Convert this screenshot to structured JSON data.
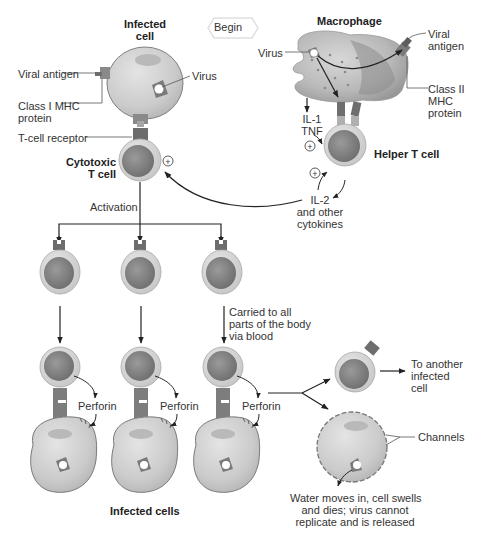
{
  "begin_label": "Begin",
  "labels": {
    "infected_cell": "Infected cell",
    "infected_cell_l1": "Infected",
    "infected_cell_l2": "cell",
    "viral_antigen_left": "Viral antigen",
    "virus_left": "Virus",
    "class1_l1": "Class I MHC",
    "class1_l2": "protein",
    "tcell_receptor": "T-cell receptor",
    "cytotoxic_l1": "Cytotoxic",
    "cytotoxic_l2": "T cell",
    "macrophage": "Macrophage",
    "virus_right": "Virus",
    "viral_antigen_r1": "Viral",
    "viral_antigen_r2": "antigen",
    "class2_l1": "Class II",
    "class2_l2": "MHC",
    "class2_l3": "protein",
    "il1": "IL-1",
    "tnf": "TNF",
    "helper_tcell": "Helper T cell",
    "il2_l1": "IL-2",
    "il2_l2": "and other",
    "il2_l3": "cytokines",
    "activation": "Activation",
    "carried_l1": "Carried to all",
    "carried_l2": "parts of the body",
    "carried_l3": "via blood",
    "perforin": "Perforin",
    "infected_cells": "Infected cells",
    "another_l1": "To another",
    "another_l2": "infected",
    "another_l3": "cell",
    "channels": "Channels",
    "water_l1": "Water moves in, cell swells",
    "water_l2": "and dies; virus cannot",
    "water_l3": "replicate and is released",
    "plus": "+"
  },
  "colors": {
    "cell_fill": "#cfcfcf",
    "cell_stroke": "#7a7a7a",
    "tcell_outer": "#d6d6d6",
    "tcell_inner": "#8c8c8c",
    "receptor": "#7d7d7d",
    "arrow": "#222222",
    "macrophage_fill": "#bdbdbd"
  }
}
